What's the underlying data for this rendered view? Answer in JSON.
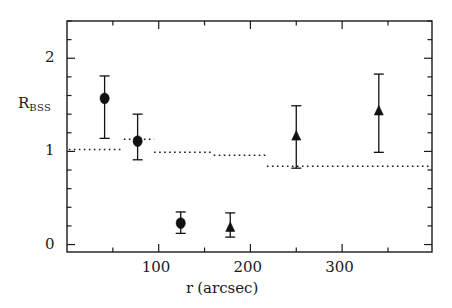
{
  "figure": {
    "background": "#ffffff",
    "ink": "#1a1a1a",
    "marker_color": "#111111"
  },
  "axes": {
    "y_label_main": "R",
    "y_label_sub": "BSS",
    "x_label_main": "r",
    "x_label_unit": "(arcsec)",
    "x_ticks": [
      {
        "value": 100,
        "label": "100"
      },
      {
        "value": 200,
        "label": "200"
      },
      {
        "value": 300,
        "label": "300"
      }
    ],
    "y_ticks": [
      {
        "value": 0,
        "label": "0"
      },
      {
        "value": 1,
        "label": "1"
      },
      {
        "value": 2,
        "label": "2"
      }
    ],
    "x_minor_step": 50,
    "y_minor_step": 0.2,
    "grid": false
  },
  "chart_data": {
    "type": "scatter",
    "title": "",
    "xlabel": "r (arcsec)",
    "ylabel": "R_BSS",
    "xlim": [
      0,
      398
    ],
    "ylim": [
      -0.08,
      2.4
    ],
    "legend": "none",
    "series": [
      {
        "name": "R_BSS (circles)",
        "marker": "circle",
        "points": [
          {
            "x": 41,
            "y": 1.57,
            "yerr_low": 0.43,
            "yerr_high": 0.24
          },
          {
            "x": 77,
            "y": 1.11,
            "yerr_low": 0.2,
            "yerr_high": 0.29
          },
          {
            "x": 124,
            "y": 0.23,
            "yerr_low": 0.11,
            "yerr_high": 0.12
          }
        ]
      },
      {
        "name": "R_BSS (triangles)",
        "marker": "triangle",
        "points": [
          {
            "x": 178,
            "y": 0.18,
            "yerr_low": 0.1,
            "yerr_high": 0.16
          },
          {
            "x": 250,
            "y": 1.16,
            "yerr_low": 0.34,
            "yerr_high": 0.33
          },
          {
            "x": 340,
            "y": 1.43,
            "yerr_low": 0.44,
            "yerr_high": 0.4
          }
        ]
      }
    ],
    "step_line": {
      "name": "reference level",
      "style": "dotted",
      "segments": [
        {
          "x_start": 2,
          "x_end": 62,
          "y": 1.02
        },
        {
          "x_start": 62,
          "x_end": 95,
          "y": 1.13
        },
        {
          "x_start": 95,
          "x_end": 160,
          "y": 0.99
        },
        {
          "x_start": 160,
          "x_end": 218,
          "y": 0.96
        },
        {
          "x_start": 218,
          "x_end": 398,
          "y": 0.84
        }
      ]
    }
  }
}
